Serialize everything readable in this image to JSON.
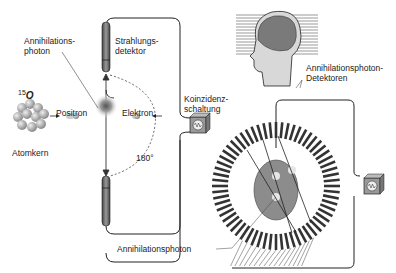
{
  "labels": {
    "annihilation_photon_top_line1": "Annihilations-",
    "annihilation_photon_top_line2": "photon",
    "radiation_detector_line1": "Strahlungs-",
    "radiation_detector_line2": "detektor",
    "isotope_mass": "15",
    "isotope_symbol": "O",
    "positron": "Positron",
    "electron": "Elektron",
    "nucleus": "Atomkern",
    "angle": "180°",
    "coincidence_line1": "Koinzidenz-",
    "coincidence_line2": "schaltung",
    "detectors_line1": "Annihilationsphoton-",
    "detectors_line2": "Detektoren",
    "annihilation_photon_bottom": "Annihilationsphoton"
  },
  "colors": {
    "background": "#ffffff",
    "line": "#222222",
    "detector": "#555555",
    "head": "#8a8a8a",
    "nucleus": "#b0b0b0"
  }
}
